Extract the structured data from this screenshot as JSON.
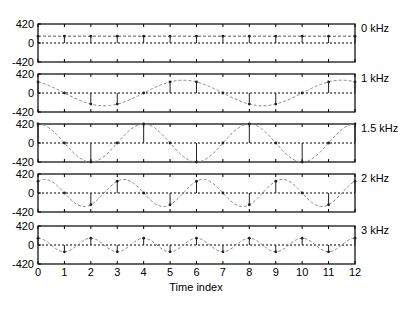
{
  "chart_data": {
    "type": "stem",
    "title": "",
    "xlabel": "Time index",
    "ylabel": "",
    "xlim": [
      0,
      12
    ],
    "ylim": [
      -420,
      420
    ],
    "x": [
      0,
      1,
      2,
      3,
      4,
      5,
      6,
      7,
      8,
      9,
      10,
      11,
      12
    ],
    "x_ticks": [
      "0",
      "1",
      "2",
      "3",
      "4",
      "5",
      "6",
      "7",
      "8",
      "9",
      "10",
      "11",
      "12"
    ],
    "y_ticks": [
      "420",
      "0",
      "-420"
    ],
    "grid": false,
    "series": [
      {
        "name": "0 kHz",
        "period": 0,
        "amplitude": 150,
        "values": [
          150,
          150,
          150,
          150,
          150,
          150,
          150,
          150,
          150,
          150,
          150,
          150,
          150
        ]
      },
      {
        "name": "1 kHz",
        "period": 6,
        "amplitude": 245,
        "values": [
          245,
          0,
          -245,
          -245,
          0,
          245,
          245,
          0,
          -245,
          -245,
          0,
          245,
          245
        ]
      },
      {
        "name": "1.5 kHz",
        "period": 4,
        "amplitude": 420,
        "values": [
          420,
          0,
          -420,
          0,
          420,
          0,
          -420,
          0,
          420,
          0,
          -420,
          0,
          420
        ]
      },
      {
        "name": "2 kHz",
        "period": 3,
        "amplitude": 260,
        "values": [
          260,
          0,
          -260,
          260,
          0,
          -260,
          260,
          0,
          -260,
          260,
          0,
          -260,
          260
        ]
      },
      {
        "name": "3 kHz",
        "period": 2,
        "amplitude": 150,
        "values": [
          150,
          -150,
          150,
          -150,
          150,
          -150,
          150,
          -150,
          150,
          -150,
          150,
          -150,
          150
        ]
      }
    ]
  },
  "colors": {
    "axes": "#000000",
    "stem": "#222222",
    "envelope": "#888888",
    "zero_line": "#000000"
  }
}
